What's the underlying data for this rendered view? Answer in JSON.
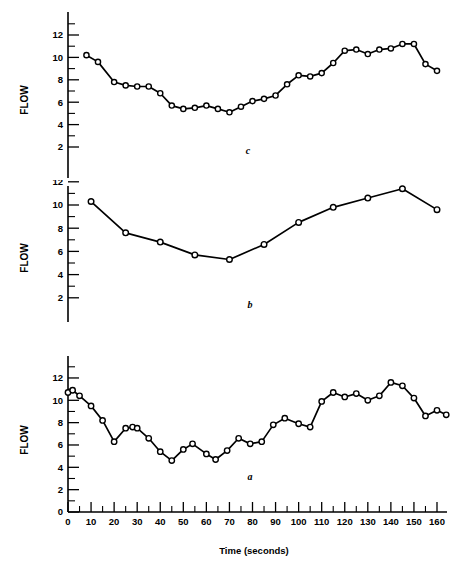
{
  "figure": {
    "xlabel": "Time (seconds)",
    "ylabel": "FLOW",
    "panel_labels": {
      "top": "c",
      "middle": "b",
      "bottom": "a"
    }
  },
  "axis": {
    "x_ticklabels": [
      "0",
      "10",
      "20",
      "30",
      "40",
      "50",
      "60",
      "70",
      "80",
      "90",
      "100",
      "110",
      "120",
      "130",
      "140",
      "150",
      "160"
    ],
    "y_ticklabels_a": [
      "0",
      "2",
      "4",
      "6",
      "8",
      "10",
      "12"
    ],
    "y_ticklabels_b": [
      "2",
      "4",
      "6",
      "8",
      "10",
      "12"
    ],
    "y_ticklabels_c": [
      "2",
      "4",
      "6",
      "8",
      "10",
      "12"
    ]
  },
  "chart_data": [
    {
      "type": "line",
      "title": "a",
      "xlabel": "Time (seconds)",
      "ylabel": "FLOW",
      "xlim": [
        0,
        165
      ],
      "ylim": [
        0,
        13
      ],
      "grid": false,
      "legend": "none",
      "x": [
        0,
        2,
        5,
        10,
        15,
        20,
        25,
        28,
        30,
        35,
        40,
        45,
        50,
        54,
        60,
        64,
        69,
        74,
        79,
        84,
        89,
        94,
        100,
        105,
        110,
        115,
        120,
        125,
        130,
        135,
        140,
        145,
        150,
        155,
        160,
        164
      ],
      "values": [
        10.7,
        10.9,
        10.4,
        9.5,
        8.2,
        6.3,
        7.5,
        7.6,
        7.5,
        6.6,
        5.4,
        4.6,
        5.6,
        6.1,
        5.2,
        4.7,
        5.5,
        6.6,
        6.1,
        6.3,
        7.8,
        8.4,
        7.9,
        7.6,
        9.9,
        10.7,
        10.3,
        10.6,
        10.0,
        10.4,
        11.6,
        11.3,
        10.2,
        8.6,
        9.1,
        8.7
      ]
    },
    {
      "type": "line",
      "title": "b",
      "xlabel": "Time (seconds)",
      "ylabel": "FLOW",
      "xlim": [
        0,
        165
      ],
      "ylim": [
        2,
        13
      ],
      "grid": false,
      "legend": "none",
      "x": [
        10,
        25,
        40,
        55,
        70,
        85,
        100,
        115,
        130,
        145,
        160
      ],
      "values": [
        10.3,
        7.6,
        6.8,
        5.7,
        5.3,
        6.6,
        8.5,
        9.8,
        10.6,
        11.4,
        9.6
      ]
    },
    {
      "type": "line",
      "title": "c",
      "xlabel": "Time (seconds)",
      "ylabel": "FLOW",
      "xlim": [
        0,
        165
      ],
      "ylim": [
        2,
        13
      ],
      "grid": false,
      "legend": "none",
      "x": [
        8,
        13,
        20,
        25,
        30,
        35,
        40,
        45,
        50,
        55,
        60,
        65,
        70,
        75,
        80,
        85,
        90,
        95,
        100,
        105,
        110,
        115,
        120,
        125,
        130,
        135,
        140,
        145,
        150,
        155,
        160
      ],
      "values": [
        10.2,
        9.6,
        7.8,
        7.5,
        7.4,
        7.4,
        6.8,
        5.7,
        5.4,
        5.5,
        5.7,
        5.4,
        5.1,
        5.6,
        6.1,
        6.3,
        6.6,
        7.6,
        8.4,
        8.3,
        8.6,
        9.5,
        10.6,
        10.7,
        10.3,
        10.7,
        10.8,
        11.2,
        11.2,
        9.4,
        8.8
      ]
    }
  ]
}
